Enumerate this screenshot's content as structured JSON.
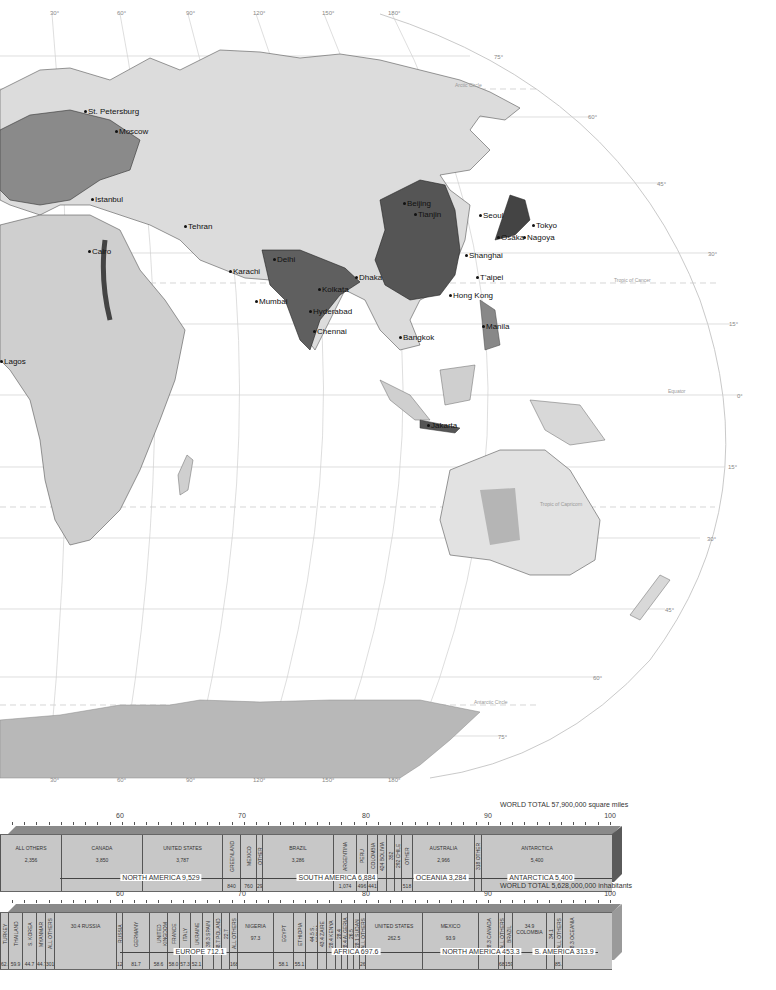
{
  "map": {
    "longitude_labels_top": [
      "30°",
      "60°",
      "90°",
      "120°",
      "150°",
      "180°"
    ],
    "longitude_labels_bottom": [
      "30°",
      "60°",
      "90°",
      "120°",
      "150°",
      "180°"
    ],
    "latitude_labels": [
      "75°",
      "60°",
      "45°",
      "30°",
      "15°",
      "0°",
      "15°",
      "30°",
      "45°",
      "60°",
      "75°"
    ],
    "special_lines": {
      "arctic": "Arctic Circle",
      "cancer": "Tropic of Cancer",
      "equator": "Equator",
      "capricorn": "Tropic of Capricorn",
      "antarctic": "Antarctic Circle"
    },
    "cities": [
      {
        "name": "St. Petersburg",
        "x": 84,
        "y": 108
      },
      {
        "name": "Moscow",
        "x": 115,
        "y": 128
      },
      {
        "name": "Istanbul",
        "x": 91,
        "y": 196
      },
      {
        "name": "Tehran",
        "x": 184,
        "y": 223
      },
      {
        "name": "Cairo",
        "x": 88,
        "y": 248
      },
      {
        "name": "Karachi",
        "x": 229,
        "y": 268
      },
      {
        "name": "Delhi",
        "x": 273,
        "y": 256
      },
      {
        "name": "Dhaka",
        "x": 355,
        "y": 274
      },
      {
        "name": "Kolkata",
        "x": 318,
        "y": 286
      },
      {
        "name": "Mumbai",
        "x": 255,
        "y": 298
      },
      {
        "name": "Hyderabad",
        "x": 309,
        "y": 308
      },
      {
        "name": "Chennai",
        "x": 313,
        "y": 328
      },
      {
        "name": "Beijing",
        "x": 403,
        "y": 200
      },
      {
        "name": "Tianjin",
        "x": 414,
        "y": 211
      },
      {
        "name": "Seoul",
        "x": 479,
        "y": 212
      },
      {
        "name": "Tokyo",
        "x": 532,
        "y": 222
      },
      {
        "name": "Osaka",
        "x": 497,
        "y": 234
      },
      {
        "name": "Nagoya",
        "x": 523,
        "y": 234
      },
      {
        "name": "Shanghai",
        "x": 465,
        "y": 252
      },
      {
        "name": "T'aipei",
        "x": 476,
        "y": 274
      },
      {
        "name": "Hong Kong",
        "x": 449,
        "y": 292
      },
      {
        "name": "Manila",
        "x": 482,
        "y": 323
      },
      {
        "name": "Bangkok",
        "x": 399,
        "y": 334
      },
      {
        "name": "Jakarta",
        "x": 427,
        "y": 422
      },
      {
        "name": "Lagos",
        "x": 0,
        "y": 358
      }
    ]
  },
  "chart_data": [
    {
      "type": "bar",
      "title": "WORLD TOTAL 57,900,000 square miles",
      "xlabel": "Percent of world land area",
      "ylabel": "",
      "ticks_labeled": [
        60,
        70,
        80,
        90,
        100
      ],
      "unit": "thousand square miles",
      "segments": [
        {
          "name": "ALL OTHERS",
          "value": 2356
        },
        {
          "name": "CANADA",
          "value": 3850
        },
        {
          "name": "UNITED STATES",
          "value": 3787
        },
        {
          "name": "GREENLAND",
          "value": 840
        },
        {
          "name": "MEXICO",
          "value": 760
        },
        {
          "name": "OTHER",
          "value": 292
        },
        {
          "name": "BRAZIL",
          "value": 3286
        },
        {
          "name": "ARGENTINA",
          "value": 1074
        },
        {
          "name": "PERU",
          "value": 496
        },
        {
          "name": "COLOMBIA",
          "value": 441
        },
        {
          "name": "BOLIVIA",
          "value": 424
        },
        {
          "name": "VENEZUELA",
          "value": 352
        },
        {
          "name": "CHILE",
          "value": 292
        },
        {
          "name": "OTHER",
          "value": 518
        },
        {
          "name": "AUSTRALIA",
          "value": 2966
        },
        {
          "name": "OTHER",
          "value": 318
        },
        {
          "name": "ANTARCTICA",
          "value": 5400
        }
      ],
      "continents": [
        {
          "label": "NORTH AMERICA 9,529"
        },
        {
          "label": "SOUTH AMERICA 6,884"
        },
        {
          "label": "OCEANIA 3,284"
        },
        {
          "label": "ANTARCTICA 5,400"
        }
      ]
    },
    {
      "type": "bar",
      "title": "WORLD TOTAL 5,628,000,000 inhabitants",
      "xlabel": "Percent of world population",
      "ylabel": "",
      "ticks_labeled": [
        60,
        70,
        80,
        90,
        100
      ],
      "unit": "million inhabitants",
      "segments": [
        {
          "name": "TURKEY",
          "value": 62.0
        },
        {
          "name": "THAILAND",
          "value": 59.9
        },
        {
          "name": "S. KOREA",
          "value": 44.7
        },
        {
          "name": "MYANMAR",
          "value": 44.7
        },
        {
          "name": "ALL OTHERS",
          "value": 301.2
        },
        {
          "name": "RUSSIA",
          "value": 30.4
        },
        {
          "name": "RUSSIA",
          "value": 120.1
        },
        {
          "name": "GERMANY",
          "value": 81.7
        },
        {
          "name": "UNITED KINGDOM",
          "value": 58.6
        },
        {
          "name": "FRANCE",
          "value": 58.0
        },
        {
          "name": "ITALY",
          "value": 57.3
        },
        {
          "name": "UKRAINE",
          "value": 52.1
        },
        {
          "name": "SPAIN",
          "value": 39.3
        },
        {
          "name": "POLAND",
          "value": 38.7
        },
        {
          "name": "ROMANIA",
          "value": 22.7
        },
        {
          "name": "ALL OTHERS",
          "value": 168.4
        },
        {
          "name": "NIGERIA",
          "value": 97.3
        },
        {
          "name": "EGYPT",
          "value": 58.1
        },
        {
          "name": "ETHIOPIA",
          "value": 55.1
        },
        {
          "name": "S. AFRICA",
          "value": 44.5
        },
        {
          "name": "ZAIRE",
          "value": 43.4
        },
        {
          "name": "KENYA",
          "value": 28.4
        },
        {
          "name": "TANZANIA",
          "value": 28.4
        },
        {
          "name": "ALGERIA",
          "value": 28.4
        },
        {
          "name": "MOROCCO",
          "value": 26.5
        },
        {
          "name": "SUDAN",
          "value": 28.1
        },
        {
          "name": "ALL OTHERS",
          "value": 261.7
        },
        {
          "name": "UNITED STATES",
          "value": 262.5
        },
        {
          "name": "MEXICO",
          "value": 93.9
        },
        {
          "name": "CANADA",
          "value": 28.3
        },
        {
          "name": "ALL OTHERS",
          "value": 68.6
        },
        {
          "name": "BRAZIL",
          "value": 159.7
        },
        {
          "name": "COLOMBIA",
          "value": 34.9
        },
        {
          "name": "ARGENTINA",
          "value": 34.1
        },
        {
          "name": "ALL OTHERS",
          "value": 85.2
        },
        {
          "name": "OCEANIA",
          "value": 28.3
        }
      ],
      "continents": [
        {
          "label": "EUROPE 712.1"
        },
        {
          "label": "AFRICA 697.6"
        },
        {
          "label": "NORTH AMERICA 453.3"
        },
        {
          "label": "S. AMERICA 313.9"
        }
      ]
    }
  ],
  "area_chart": {
    "total": "WORLD TOTAL 57,900,000 square miles",
    "ticks": [
      "60",
      "70",
      "80",
      "90",
      "100"
    ],
    "segs": [
      {
        "n": "ALL OTHERS",
        "v": "2,356"
      },
      {
        "n": "CANADA",
        "v": "3,850"
      },
      {
        "n": "UNITED STATES",
        "v": "3,787"
      },
      {
        "n": "GREENLAND",
        "v": "840"
      },
      {
        "n": "MEXICO",
        "v": "760"
      },
      {
        "n": "OTHER",
        "v": "292"
      },
      {
        "n": "BRAZIL",
        "v": "3,286"
      },
      {
        "n": "ARGENTINA",
        "v": "1,074"
      },
      {
        "n": "PERU",
        "v": "496"
      },
      {
        "n": "COLOMBIA",
        "v": "441"
      },
      {
        "n": "424 BOLIVIA",
        "v": ""
      },
      {
        "n": "352 VENEZUELA",
        "v": ""
      },
      {
        "n": "292 CHILE",
        "v": ""
      },
      {
        "n": "OTHER",
        "v": "518"
      },
      {
        "n": "AUSTRALIA",
        "v": "2,966"
      },
      {
        "n": "318 OTHER",
        "v": ""
      },
      {
        "n": "ANTARCTICA",
        "v": "5,400"
      }
    ],
    "continents": [
      "NORTH AMERICA 9,529",
      "SOUTH AMERICA 6,884",
      "OCEANIA 3,284",
      "ANTARCTICA 5,400"
    ]
  },
  "pop_chart": {
    "total": "WORLD TOTAL 5,628,000,000 inhabitants",
    "ticks": [
      "60",
      "70",
      "80",
      "90",
      "100"
    ],
    "segs": [
      {
        "n": "TURKEY",
        "v": "62.0"
      },
      {
        "n": "THAILAND",
        "v": "59.9"
      },
      {
        "n": "S. KOREA",
        "v": "44.7"
      },
      {
        "n": "MYANMAR",
        "v": "44.7"
      },
      {
        "n": "ALL OTHERS",
        "v": "301.2"
      },
      {
        "n": "30.4 RUSSIA",
        "v": ""
      },
      {
        "n": "RUSSIA",
        "v": "120.1"
      },
      {
        "n": "GERMANY",
        "v": "81.7"
      },
      {
        "n": "UNITED KINGDOM",
        "v": "58.6"
      },
      {
        "n": "FRANCE",
        "v": "58.0"
      },
      {
        "n": "ITALY",
        "v": "57.3"
      },
      {
        "n": "UKRAINE",
        "v": "52.1"
      },
      {
        "n": "39.3 SPAIN",
        "v": ""
      },
      {
        "n": "38.7 POLAND",
        "v": ""
      },
      {
        "n": "22.7 ROMANIA",
        "v": ""
      },
      {
        "n": "ALL OTHERS",
        "v": "168.4"
      },
      {
        "n": "NIGERIA",
        "v": "97.3"
      },
      {
        "n": "EGYPT",
        "v": "58.1"
      },
      {
        "n": "ETHIOPIA",
        "v": "55.1"
      },
      {
        "n": "44.5 S. AFRICA",
        "v": ""
      },
      {
        "n": "43.4 ZAIRE",
        "v": ""
      },
      {
        "n": "28.4 KENYA",
        "v": ""
      },
      {
        "n": "28.4 TANZANIA",
        "v": ""
      },
      {
        "n": "28.4 ALGERIA",
        "v": ""
      },
      {
        "n": "26.5 MOROCCO",
        "v": ""
      },
      {
        "n": "28.1 SUDAN",
        "v": ""
      },
      {
        "n": "ALL OTHERS",
        "v": "261.7"
      },
      {
        "n": "UNITED STATES",
        "v": "262.5"
      },
      {
        "n": "MEXICO",
        "v": "93.9"
      },
      {
        "n": "28.3 CANADA",
        "v": ""
      },
      {
        "n": "ALL OTHERS",
        "v": "68.6"
      },
      {
        "n": "BRAZIL",
        "v": "159.7"
      },
      {
        "n": "34.9 COLOMBIA",
        "v": ""
      },
      {
        "n": "34.1 ARGENTINA",
        "v": ""
      },
      {
        "n": "ALL OTHERS",
        "v": "85.2"
      },
      {
        "n": "28.3 OCEANIA",
        "v": ""
      }
    ],
    "continents": [
      "EUROPE 712.1",
      "AFRICA 697.6",
      "NORTH AMERICA 453.3",
      "S. AMERICA 313.9"
    ]
  }
}
